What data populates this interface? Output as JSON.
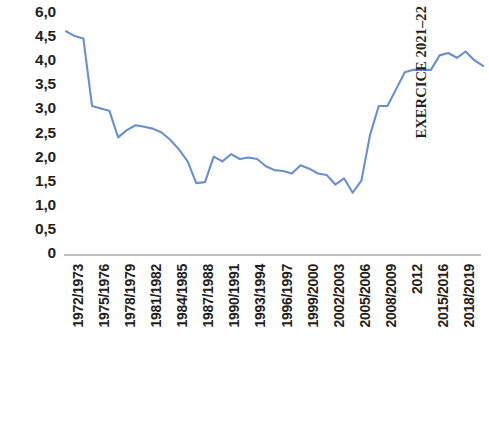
{
  "chart_data": {
    "type": "line",
    "title": "",
    "subtitle": "",
    "xlabel": "EXERCICE 2021–22",
    "ylabel": "",
    "ylim": [
      0,
      6.0
    ],
    "grid": false,
    "legend": null,
    "line_color": "#6a8fd0",
    "baseline_color": "#bfbfbf",
    "y_ticks": [
      "6,0",
      "4,5",
      "4,0",
      "3,5",
      "3,0",
      "2,5",
      "2,0",
      "1,5",
      "1,0",
      "0,5",
      "0"
    ],
    "y_tick_values": [
      6.0,
      4.5,
      4.0,
      3.5,
      3.0,
      2.5,
      2.0,
      1.5,
      1.0,
      0.5,
      0
    ],
    "x_tick_labels": [
      "1972/1973",
      "1975/1976",
      "1978/1979",
      "1981/1982",
      "1984/1985",
      "1987/1988",
      "1990/1991",
      "1993/1994",
      "1996/1997",
      "1999/2000",
      "2002/2003",
      "2005/2006",
      "2008/2009",
      "2012",
      "2015/2016",
      "2018/2019"
    ],
    "categories": [
      "1972/1973",
      "1973/1974",
      "1974/1975",
      "1975/1976",
      "1976/1977",
      "1977/1978",
      "1978/1979",
      "1979/1980",
      "1980/1981",
      "1981/1982",
      "1982/1983",
      "1983/1984",
      "1984/1985",
      "1985/1986",
      "1986/1987",
      "1987/1988",
      "1988/1989",
      "1989/1990",
      "1990/1991",
      "1991/1992",
      "1992/1993",
      "1993/1994",
      "1994/1995",
      "1995/1996",
      "1996/1997",
      "1997/1998",
      "1998/1999",
      "1999/2000",
      "2000/2001",
      "2001/2002",
      "2002/2003",
      "2003/2004",
      "2004/2005",
      "2005/2006",
      "2006/2007",
      "2007/2008",
      "2008/2009",
      "2009/2010",
      "2010/2011",
      "2012",
      "2013",
      "2014",
      "2015/2016",
      "2016/2017",
      "2017/2018",
      "2018/2019",
      "2019/2020",
      "2020/2021",
      "2021/2022"
    ],
    "values": [
      4.6,
      4.5,
      4.45,
      3.05,
      3.0,
      2.95,
      2.4,
      2.55,
      2.65,
      2.62,
      2.58,
      2.5,
      2.35,
      2.15,
      1.9,
      1.45,
      1.47,
      2.0,
      1.9,
      2.05,
      1.95,
      1.98,
      1.95,
      1.8,
      1.72,
      1.7,
      1.65,
      1.82,
      1.75,
      1.65,
      1.62,
      1.42,
      1.55,
      1.25,
      1.5,
      2.45,
      3.05,
      3.05,
      3.4,
      3.75,
      3.8,
      3.8,
      3.8,
      4.1,
      4.15,
      4.05,
      4.18,
      4.0,
      3.88
    ]
  }
}
